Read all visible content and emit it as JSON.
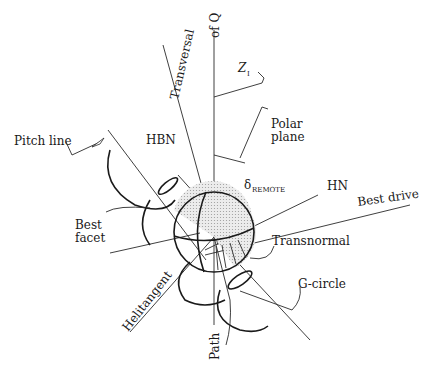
{
  "diagram": {
    "type": "axis-schematic",
    "labels": {
      "of_q": "of Q",
      "transversal": "Transversal",
      "z": "Z",
      "z_sub": "I",
      "polar_plane_1": "Polar",
      "polar_plane_2": "plane",
      "pitch_line": "Pitch line",
      "hbn": "HBN",
      "delta": "δ",
      "delta_sub": "REMOTE",
      "hn": "HN",
      "best_drive": "Best drive",
      "best_facet_1": "Best",
      "best_facet_2": "facet",
      "transnormal": "Transnormal",
      "g_circle": "G-circle",
      "helitangent": "Helitangent",
      "path": "Path"
    },
    "colors": {
      "line": "#2a2a2a",
      "shade": "#d9d9d9",
      "background": "#ffffff"
    }
  }
}
